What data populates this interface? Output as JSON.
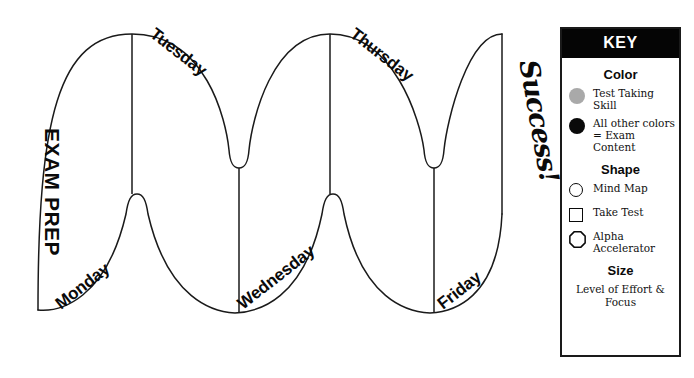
{
  "diagram": {
    "title_label": "EXAM PREP",
    "outcome_label": "Success!",
    "day_labels": [
      {
        "text": "Monday",
        "x": 58,
        "y": 296,
        "rotate": -38
      },
      {
        "text": "Tuesday",
        "x": 152,
        "y": 22,
        "rotate": 38
      },
      {
        "text": "Wednesday",
        "x": 240,
        "y": 296,
        "rotate": -38
      },
      {
        "text": "Thursday",
        "x": 352,
        "y": 22,
        "rotate": 38
      },
      {
        "text": "Friday",
        "x": 440,
        "y": 296,
        "rotate": -38
      }
    ]
  },
  "legend": {
    "header": "KEY",
    "sections": [
      {
        "title": "Color",
        "rows": [
          {
            "swatch": "filled-gray-circle",
            "label": "Test Taking Skill"
          },
          {
            "swatch": "filled-black-circle",
            "label": "All other colors = Exam Content"
          }
        ]
      },
      {
        "title": "Shape",
        "rows": [
          {
            "swatch": "open-circle",
            "label": "Mind Map"
          },
          {
            "swatch": "open-square",
            "label": "Take Test"
          },
          {
            "swatch": "open-octagon",
            "label": "Alpha Accelerator"
          }
        ]
      },
      {
        "title": "Size",
        "note": "Level of Effort & Focus"
      }
    ]
  },
  "colors": {
    "ink": "#0a0a0a",
    "header_bg": "#050505",
    "header_text": "#ffffff",
    "gray_swatch": "#a9a9a9",
    "background": "#ffffff"
  }
}
